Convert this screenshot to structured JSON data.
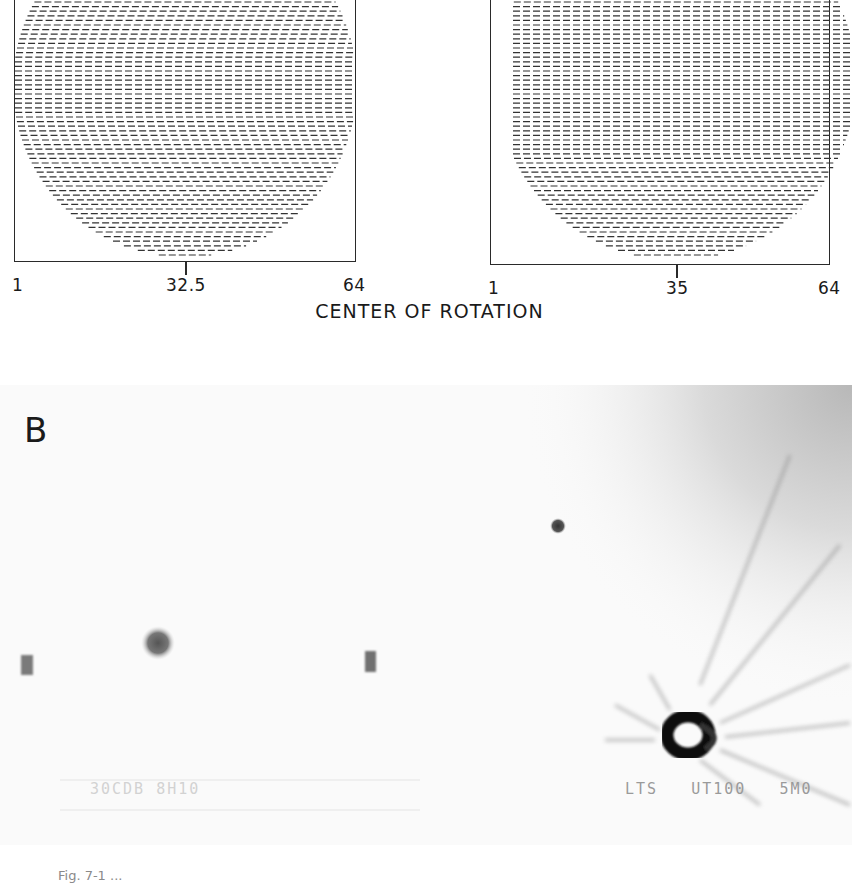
{
  "figure": {
    "panel_a": {
      "left_plot": {
        "axis_ticks": {
          "min": "1",
          "center": "32.5",
          "max": "64"
        },
        "center_value": 32.5
      },
      "right_plot": {
        "axis_ticks": {
          "min": "1",
          "center": "35",
          "max": "64"
        },
        "center_value": 35
      },
      "title": "CENTER OF ROTATION"
    },
    "panel_b": {
      "letter": "B",
      "overlay_left": "30CDB 8H10",
      "overlay_right": "LTS   UT100   5M0",
      "features": [
        {
          "type": "bar-source",
          "x": 27,
          "y": 280
        },
        {
          "type": "blob-source",
          "x": 158,
          "y": 258
        },
        {
          "type": "bar-source",
          "x": 370,
          "y": 277
        },
        {
          "type": "small-dot",
          "x": 558,
          "y": 141
        },
        {
          "type": "ring-source",
          "x": 688,
          "y": 355
        }
      ]
    },
    "caption_fragment": "Fig. 7-1 ..."
  }
}
